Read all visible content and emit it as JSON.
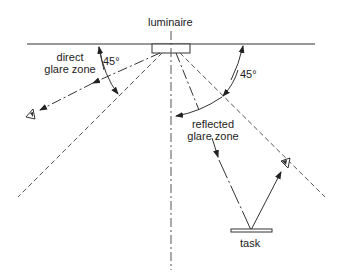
{
  "diagram": {
    "labels": {
      "luminaire": "luminaire",
      "direct_glare_line1": "direct",
      "direct_glare_line2": "glare zone",
      "angle_left": "45°",
      "angle_right": "45°",
      "reflected_glare_line1": "reflected",
      "reflected_glare_line2": "glare zone",
      "task": "task"
    },
    "colors": {
      "line": "#333333",
      "dashed": "#555555",
      "background": "#ffffff"
    },
    "elements": [
      "ceiling",
      "luminaire",
      "vertical-axis",
      "left-45-boundary",
      "right-45-boundary",
      "direct-glare-ray",
      "reflected-ray-incident",
      "reflected-ray-to-eye",
      "left-eye",
      "right-eye",
      "task-surface"
    ]
  }
}
